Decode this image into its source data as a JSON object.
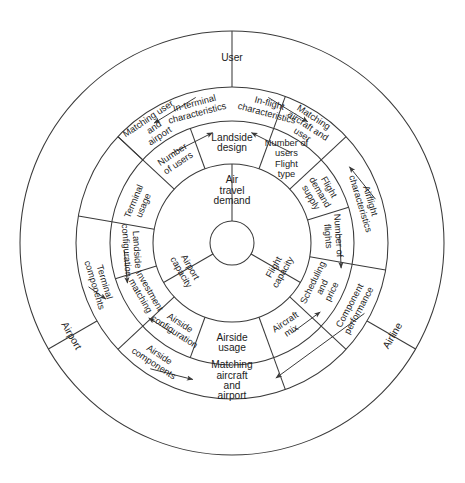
{
  "diagram": {
    "center_hub": {
      "label": ""
    },
    "geometry": {
      "cx": 232,
      "cy": 243,
      "r_hub": 22,
      "r_ring1": 79,
      "r_ring2": 122,
      "r_ring3": 156,
      "r_outer": 212
    },
    "colors": {
      "stroke": "#3a3a3a",
      "text": "#1c1c1c",
      "background": "#ffffff"
    },
    "ring1": {
      "name": "core-demand-capacity",
      "sectors": [
        {
          "id": "air-travel-demand",
          "label": "Air travel demand",
          "lines": [
            "Air",
            "travel",
            "demand"
          ],
          "orient": "upright"
        },
        {
          "id": "flight-capacity",
          "label": "Flight capacity",
          "lines": [
            "Flight",
            "capacity"
          ],
          "orient": "radial"
        },
        {
          "id": "airport-capacity",
          "label": "Airport capacity",
          "lines": [
            "Airport",
            "capacity"
          ],
          "orient": "radial"
        }
      ]
    },
    "ring2": {
      "name": "usage-design-configuration",
      "sectors": [
        {
          "id": "landside-design",
          "label": "Landside design",
          "lines": [
            "Landside",
            "design"
          ],
          "orient": "upright"
        },
        {
          "id": "number-of-users-flight-type",
          "label": "Number of users Flight type",
          "lines": [
            "Number of",
            "users",
            "Flight",
            "type"
          ],
          "orient": "upright"
        },
        {
          "id": "flight-demand-supply",
          "label": "Flight demand supply",
          "lines": [
            "Flight",
            "demand",
            "supply"
          ],
          "orient": "radial"
        },
        {
          "id": "number-of-flights",
          "label": "Number of flights",
          "lines": [
            "Number of",
            "flights"
          ],
          "orient": "radial"
        },
        {
          "id": "scheduling-and-price",
          "label": "Scheduling and price",
          "lines": [
            "Scheduling",
            "and",
            "price"
          ],
          "orient": "radial"
        },
        {
          "id": "aircraft-mix",
          "label": "Aircraft mix",
          "lines": [
            "Aircraft",
            "mix"
          ],
          "orient": "radial"
        },
        {
          "id": "airside-usage",
          "label": "Airside usage",
          "lines": [
            "Airside",
            "usage"
          ],
          "orient": "upright"
        },
        {
          "id": "airside-configuration",
          "label": "Airside configuration",
          "lines": [
            "Airside",
            "configuration"
          ],
          "orient": "radial"
        },
        {
          "id": "investment-matching",
          "label": "Investment matching",
          "lines": [
            "Investment",
            "matching"
          ],
          "orient": "radial"
        },
        {
          "id": "landside-configuration",
          "label": "Landside configuration",
          "lines": [
            "Landside",
            "configuration"
          ],
          "orient": "radial"
        },
        {
          "id": "terminal-usage",
          "label": "Terminal usage",
          "lines": [
            "Terminal",
            "usage"
          ],
          "orient": "radial"
        },
        {
          "id": "number-of-users",
          "label": "Number of users",
          "lines": [
            "Number",
            "of users"
          ],
          "orient": "radial"
        }
      ]
    },
    "ring3": {
      "name": "characteristics-matching-components",
      "sectors": [
        {
          "id": "in-terminal-characteristics",
          "label": "In-terminal characteristics",
          "lines": [
            "In-terminal",
            "characteristics"
          ],
          "orient": "radial"
        },
        {
          "id": "in-flight-characteristics",
          "label": "In-flight characteristics",
          "lines": [
            "In-flight",
            "characteristics"
          ],
          "orient": "radial"
        },
        {
          "id": "matching-aircraft-and-user",
          "label": "Matching aircraft and user",
          "lines": [
            "Matching",
            "aircraft and",
            "user"
          ],
          "orient": "radial"
        },
        {
          "id": "airflight-characteristics",
          "label": "Airflight characteristics",
          "lines": [
            "Airflight",
            "characteristics"
          ],
          "orient": "radial"
        },
        {
          "id": "component-performance",
          "label": "Component performance",
          "lines": [
            "Component",
            "performance"
          ],
          "orient": "radial"
        },
        {
          "id": "matching-aircraft-and-airport",
          "label": "Matching aircraft and airport",
          "lines": [
            "Matching",
            "aircraft",
            "and",
            "airport"
          ],
          "orient": "upright"
        },
        {
          "id": "airside-components",
          "label": "Airside components",
          "lines": [
            "Airside",
            "components"
          ],
          "orient": "radial"
        },
        {
          "id": "terminal-components",
          "label": "Terminal components",
          "lines": [
            "Terminal",
            "components"
          ],
          "orient": "radial"
        },
        {
          "id": "matching-user-and-airport",
          "label": "Matching user and airport",
          "lines": [
            "Matching user",
            "and",
            "airport"
          ],
          "orient": "radial"
        }
      ]
    },
    "ring4": {
      "name": "stakeholders",
      "sectors": [
        {
          "id": "user",
          "label": "User",
          "orient": "upright"
        },
        {
          "id": "airline",
          "label": "Airline",
          "orient": "radial"
        },
        {
          "id": "airport",
          "label": "Airport",
          "orient": "radial"
        }
      ]
    },
    "arrows": [
      {
        "id": "arrow-users-to-landside-design",
        "from": "number-of-users",
        "to": "landside-design"
      },
      {
        "id": "arrow-usertype-to-landside-design",
        "from": "number-of-users-flight-type",
        "to": "landside-design"
      },
      {
        "id": "arrow-interminal-to-matching-user-airport",
        "from": "in-terminal-characteristics",
        "to": "matching-user-and-airport"
      },
      {
        "id": "arrow-terminal-components-to-matching-user-airport",
        "from": "terminal-components",
        "to": "matching-user-and-airport"
      },
      {
        "id": "arrow-inflight-to-matching-aircraft-user",
        "from": "in-flight-characteristics",
        "to": "matching-aircraft-and-user"
      },
      {
        "id": "arrow-airflight-to-matching-aircraft-user",
        "from": "airflight-characteristics",
        "to": "matching-aircraft-and-user"
      },
      {
        "id": "arrow-flights-to-scheduling-price",
        "from": "number-of-flights",
        "to": "scheduling-and-price"
      },
      {
        "id": "arrow-aircraft-mix-to-scheduling-price",
        "from": "aircraft-mix",
        "to": "scheduling-and-price"
      },
      {
        "id": "arrow-airside-config-to-investment-matching",
        "from": "airside-configuration",
        "to": "investment-matching"
      },
      {
        "id": "arrow-landside-config-to-investment-matching",
        "from": "landside-configuration",
        "to": "investment-matching"
      },
      {
        "id": "arrow-airside-components-to-matching-aircraft-airport",
        "from": "airside-components",
        "to": "matching-aircraft-and-airport"
      },
      {
        "id": "arrow-component-performance-to-matching-aircraft-airport",
        "from": "component-performance",
        "to": "matching-aircraft-and-airport"
      }
    ]
  }
}
